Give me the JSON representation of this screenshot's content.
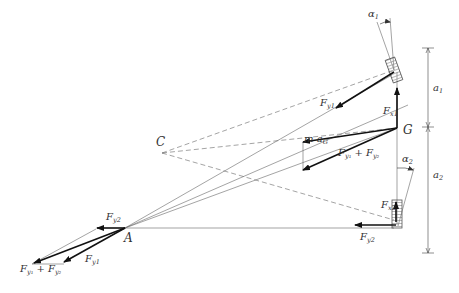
{
  "diagram": {
    "points": {
      "A": {
        "label": "A",
        "x": 125,
        "y": 228
      },
      "C": {
        "label": "C",
        "x": 162,
        "y": 153
      },
      "G": {
        "label": "G",
        "x": 397,
        "y": 128
      }
    },
    "labels": {
      "alpha1": {
        "base": "α",
        "sub": "1"
      },
      "alpha2": {
        "base": "α",
        "sub": "2"
      },
      "a1": {
        "base": "a",
        "sub": "1"
      },
      "a2": {
        "base": "a",
        "sub": "2"
      },
      "Fy1_front": {
        "base": "F",
        "sub": "y",
        "subsub": "1"
      },
      "Fx1": {
        "base": "F",
        "sub": "x",
        "subsub": "1"
      },
      "maG": {
        "text": "m a",
        "sub": "G"
      },
      "Fsum_center": {
        "text": "F",
        "sub1": "y₁",
        "plus": " + F",
        "sub2": "y₂"
      },
      "Fx2": {
        "base": "F",
        "sub": "x",
        "subsub": "2"
      },
      "Fy2_rear": {
        "base": "F",
        "sub": "y",
        "subsub": "2"
      },
      "Fy2_A": {
        "base": "F",
        "sub": "y",
        "subsub": "2"
      },
      "Fy1_A": {
        "base": "F",
        "sub": "y",
        "subsub": "1"
      },
      "Fsum_A": {
        "text": "F",
        "sub1": "y₁",
        "plus": " + F",
        "sub2": "y₂"
      }
    },
    "colors": {
      "line": "#555555",
      "arrow": "#111111",
      "tyre_fill": "#ffffff",
      "text": "#333333"
    }
  }
}
